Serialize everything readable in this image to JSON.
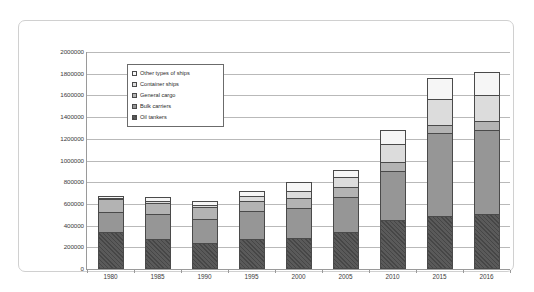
{
  "chart_data": {
    "type": "bar",
    "subtype": "stacked-vertical",
    "title": "",
    "xlabel": "",
    "ylabel": "",
    "ylim": [
      0,
      2000000
    ],
    "ytick_step": 200000,
    "ytick_labels": [
      "0",
      "200000",
      "400000",
      "600000",
      "800000",
      "1000000",
      "1200000",
      "1400000",
      "1600000",
      "1800000",
      "2000000"
    ],
    "ytick_values": [
      0,
      200000,
      400000,
      600000,
      800000,
      1000000,
      1200000,
      1400000,
      1600000,
      1800000,
      2000000
    ],
    "grid": true,
    "grid_axis": "y",
    "legend_position": "upper-left-inside",
    "categories": [
      "1980",
      "1985",
      "1990",
      "1995",
      "2000",
      "2005",
      "2010",
      "2015",
      "2016"
    ],
    "series": [
      {
        "name": "Oil tankers",
        "color": "#5a5a5a",
        "pattern": "diagonal-hatch",
        "values": [
          339000,
          281000,
          237000,
          275000,
          282000,
          340000,
          450000,
          490000,
          505000
        ]
      },
      {
        "name": "Bulk carriers",
        "color": "#969696",
        "pattern": "solid",
        "values": [
          186000,
          222000,
          228000,
          257000,
          276000,
          323000,
          456000,
          760000,
          780000
        ]
      },
      {
        "name": "General cargo",
        "color": "#b3b3b3",
        "pattern": "solid",
        "values": [
          116000,
          106000,
          103000,
          94000,
          101000,
          92000,
          80000,
          75000,
          77000
        ]
      },
      {
        "name": "Container ships",
        "color": "#dcdcdc",
        "pattern": "solid",
        "values": [
          11000,
          20000,
          26000,
          44000,
          64000,
          98000,
          169000,
          244000,
          244000
        ]
      },
      {
        "name": "Other types of ships",
        "color": "#f6f6f6",
        "pattern": "solid",
        "values": [
          21000,
          32000,
          37000,
          48000,
          75000,
          62000,
          129000,
          190000,
          210000
        ]
      }
    ],
    "totals": [
      673000,
      661000,
      631000,
      718000,
      798000,
      915000,
      1284000,
      1759000,
      1816000
    ]
  },
  "legend": {
    "items": [
      {
        "label": "Other types of ships",
        "series": "Other types of ships"
      },
      {
        "label": "Container ships",
        "series": "Container ships"
      },
      {
        "label": "General cargo",
        "series": "General cargo"
      },
      {
        "label": "Bulk carriers",
        "series": "Bulk carriers"
      },
      {
        "label": "Oil tankers",
        "series": "Oil tankers"
      }
    ]
  }
}
